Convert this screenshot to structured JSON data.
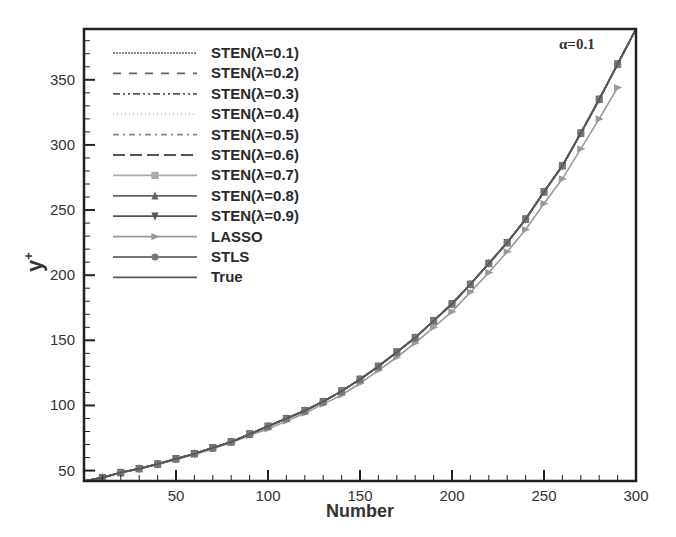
{
  "chart_data": {
    "type": "line",
    "title": "",
    "annotation": "α=0.1",
    "xlabel": "Number",
    "ylabel": "y+",
    "xlim": [
      0,
      300
    ],
    "ylim": [
      42,
      389
    ],
    "xticks": [
      50,
      100,
      150,
      200,
      250,
      300
    ],
    "yticks": [
      50,
      100,
      150,
      200,
      250,
      300,
      350
    ],
    "grid": false,
    "legend_position": "upper-left",
    "x": [
      0,
      10,
      20,
      30,
      40,
      50,
      60,
      70,
      80,
      90,
      100,
      110,
      120,
      130,
      140,
      150,
      160,
      170,
      180,
      190,
      200,
      210,
      220,
      230,
      240,
      250,
      260,
      270,
      280,
      290,
      300
    ],
    "series": [
      {
        "name": "STEN(λ=0.1)",
        "style": "dotted-dense",
        "color": "#8a8a8a",
        "marker": "none",
        "values": [
          42,
          44.6,
          48.5,
          51.5,
          55,
          59,
          63,
          67.5,
          72,
          78,
          84,
          90,
          96,
          103,
          111,
          120,
          130,
          141,
          152,
          165,
          178,
          193,
          209,
          225,
          243,
          264,
          284,
          309,
          335,
          362,
          389
        ]
      },
      {
        "name": "STEN(λ=0.2)",
        "style": "dashed",
        "color": "#666666",
        "marker": "none",
        "values": [
          42,
          44.6,
          48.5,
          51.5,
          55,
          59,
          63,
          67.5,
          72,
          78,
          84,
          90,
          96,
          103,
          111,
          120,
          130,
          141,
          152,
          165,
          178,
          193,
          209,
          225,
          243,
          264,
          284,
          309,
          335,
          362,
          389
        ]
      },
      {
        "name": "STEN(λ=0.3)",
        "style": "dash-dot-dot",
        "color": "#555555",
        "marker": "none",
        "values": [
          42,
          44.6,
          48.5,
          51.5,
          55,
          59,
          63,
          67.5,
          72,
          78,
          84,
          90,
          96,
          103,
          111,
          120,
          130,
          141,
          152,
          165,
          178,
          193,
          209,
          225,
          243,
          264,
          284,
          309,
          335,
          362,
          389
        ]
      },
      {
        "name": "STEN(λ=0.4)",
        "style": "dotted-light",
        "color": "#bbbbbb",
        "marker": "none",
        "values": [
          42,
          44.6,
          48.5,
          51.5,
          55,
          59,
          63,
          67.5,
          72,
          78,
          84,
          90,
          96,
          103,
          111,
          120,
          130,
          141,
          152,
          165,
          178,
          193,
          209,
          225,
          243,
          264,
          284,
          309,
          335,
          362,
          389
        ]
      },
      {
        "name": "STEN(λ=0.5)",
        "style": "dash-dot",
        "color": "#888888",
        "marker": "none",
        "values": [
          42,
          44.6,
          48.5,
          51.5,
          55,
          59,
          63,
          67.5,
          72,
          78,
          84,
          90,
          96,
          103,
          111,
          120,
          130,
          141,
          152,
          165,
          178,
          193,
          209,
          225,
          243,
          264,
          284,
          309,
          335,
          362,
          389
        ]
      },
      {
        "name": "STEN(λ=0.6)",
        "style": "long-dash",
        "color": "#555555",
        "marker": "none",
        "values": [
          42,
          44.6,
          48.5,
          51.5,
          55,
          59,
          63,
          67.5,
          72,
          78,
          84,
          90,
          96,
          103,
          111,
          120,
          130,
          141,
          152,
          165,
          178,
          193,
          209,
          225,
          243,
          264,
          284,
          309,
          335,
          362,
          389
        ]
      },
      {
        "name": "STEN(λ=0.7)",
        "style": "solid",
        "color": "#aaaaaa",
        "marker": "square",
        "values": [
          42,
          44.6,
          48.5,
          51.5,
          55,
          59,
          63,
          67.5,
          72,
          78,
          84,
          90,
          96,
          103,
          111,
          120,
          130,
          141,
          152,
          165,
          178,
          193,
          209,
          225,
          243,
          264,
          284,
          309,
          335,
          362,
          389
        ]
      },
      {
        "name": "STEN(λ=0.8)",
        "style": "solid",
        "color": "#666666",
        "marker": "triangle-up",
        "values": [
          42,
          44.6,
          48.5,
          51.5,
          55,
          59,
          63,
          67.5,
          72,
          78,
          84,
          90,
          96,
          103,
          111,
          120,
          130,
          141,
          152,
          165,
          178,
          193,
          209,
          225,
          243,
          264,
          284,
          309,
          335,
          362,
          389
        ]
      },
      {
        "name": "STEN(λ=0.9)",
        "style": "solid",
        "color": "#555555",
        "marker": "triangle-down",
        "values": [
          42,
          44.6,
          48.5,
          51.5,
          55,
          59,
          63,
          67.5,
          72,
          78,
          84,
          90,
          96,
          103,
          111,
          120,
          130,
          141,
          152,
          165,
          178,
          193,
          209,
          225,
          243,
          264,
          284,
          309,
          335,
          362,
          389
        ]
      },
      {
        "name": "LASSO",
        "style": "solid",
        "color": "#999999",
        "marker": "triangle-right",
        "values": [
          42,
          44.5,
          48.3,
          51.2,
          54.6,
          58.5,
          62.4,
          66.8,
          71.5,
          77,
          82,
          88,
          94,
          101,
          108,
          117,
          127,
          137,
          148,
          160,
          172,
          187,
          202,
          218,
          235,
          255,
          274,
          297,
          320,
          344,
          null
        ]
      },
      {
        "name": "STLS",
        "style": "solid",
        "color": "#777777",
        "marker": "circle",
        "values": [
          42,
          44.6,
          48.5,
          51.5,
          55,
          59,
          63,
          67.5,
          72,
          78,
          84,
          90,
          96,
          103,
          111,
          120,
          130,
          141,
          152,
          165,
          178,
          193,
          209,
          225,
          243,
          264,
          284,
          309,
          335,
          362,
          389
        ]
      },
      {
        "name": "True",
        "style": "solid",
        "color": "#555555",
        "marker": "none",
        "values": [
          42,
          44.6,
          48.5,
          51.5,
          55,
          59,
          63,
          67.5,
          72,
          78,
          84,
          90,
          96,
          103,
          111,
          120,
          130,
          141,
          152,
          165,
          178,
          193,
          209,
          225,
          243,
          264,
          284,
          309,
          335,
          362,
          389
        ]
      }
    ]
  }
}
